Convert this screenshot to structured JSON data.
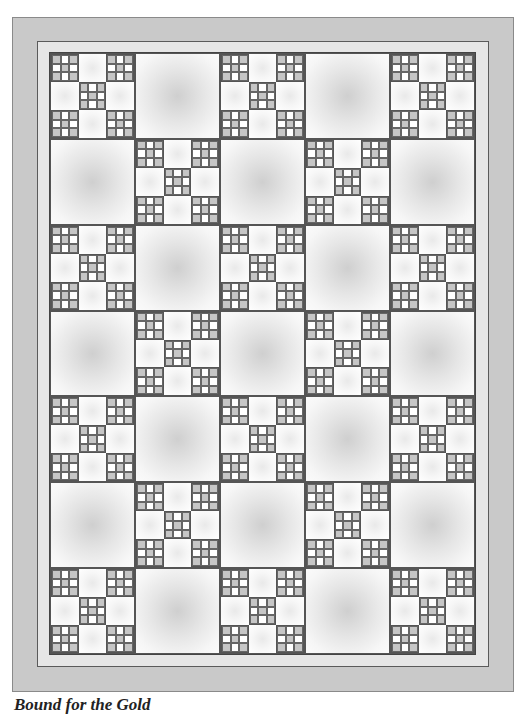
{
  "quilt": {
    "columns": 5,
    "rows": 7,
    "layout": "checkerboard",
    "pieced_block_rule": "row+column even",
    "pieced_block": {
      "units": [
        "nine-patch",
        "plain",
        "nine-patch",
        "plain",
        "nine-patch",
        "plain",
        "nine-patch",
        "plain",
        "nine-patch"
      ],
      "nine_patch_cells": [
        "dark",
        "light",
        "dark",
        "light",
        "dark",
        "light",
        "dark",
        "light",
        "dark"
      ]
    },
    "colors": {
      "outer_border": "#c9c9c9",
      "inner_border": "#e6e6e6",
      "dark_cell": "#c6c6c6",
      "light_cell": "#ffffff",
      "seam_line": "#555555"
    }
  },
  "caption": {
    "text": "Bound for the Gold"
  }
}
